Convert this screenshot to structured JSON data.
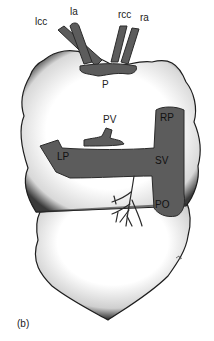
{
  "figure": {
    "caption": "(b)",
    "colors": {
      "vessel_fill": "#5c5c5c",
      "vessel_stroke": "#2a2a2a",
      "organ_fill": "#ffffff",
      "stipple": "#1a1a1a"
    },
    "labels": {
      "lcc": "lcc",
      "la": "la",
      "rcc": "rcc",
      "ra": "ra",
      "p": "P",
      "pv": "PV",
      "rp": "RP",
      "lp": "LP",
      "sv": "SV",
      "po": "PO"
    }
  }
}
